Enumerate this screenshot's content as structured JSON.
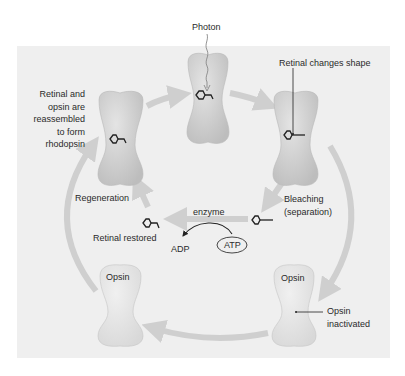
{
  "diagram": {
    "colors": {
      "panel": "#efefef",
      "rhodopsin_fill": "#d2d2d2",
      "opsin_fill": "#e6e6e6",
      "arrow": "#cfcfcf",
      "ink": "#2a2a2a"
    },
    "labels": {
      "photon": "Photon",
      "retinal_changes_shape": "Retinal changes shape",
      "reassembled_lines": [
        "Retinal and",
        "opsin are",
        "reassembled",
        "to form",
        "rhodopsin"
      ],
      "regeneration": "Regeneration",
      "enzyme": "enzyme",
      "retinal_restored": "Retinal restored",
      "adp": "ADP",
      "atp": "ATP",
      "bleaching_lines": [
        "Bleaching",
        "(separation)"
      ],
      "opsin_left": "Opsin",
      "opsin_right": "Opsin",
      "opsin_inactivated_lines": [
        "Opsin",
        "inactivated"
      ]
    },
    "nodes": [
      {
        "id": "rhodopsin-top",
        "state": "rhodopsin, photon absorbed"
      },
      {
        "id": "rhodopsin-right",
        "state": "retinal changed shape"
      },
      {
        "id": "opsin-right",
        "state": "opsin inactivated"
      },
      {
        "id": "opsin-left",
        "state": "opsin"
      },
      {
        "id": "rhodopsin-left",
        "state": "reassembled rhodopsin"
      }
    ]
  }
}
